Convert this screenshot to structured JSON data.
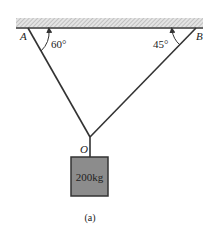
{
  "diagram": {
    "caption": "(a)",
    "points": {
      "A": {
        "label": "A"
      },
      "B": {
        "label": "B"
      },
      "O": {
        "label": "O"
      }
    },
    "angles": {
      "at_A": "60°",
      "at_B": "45°"
    },
    "mass": {
      "label": "200kg",
      "fill_color": "#8c8c8c"
    },
    "ceiling": {
      "hatch_color": "#bdbdbd",
      "line_color": "#333333"
    },
    "cable_color": "#333333"
  }
}
